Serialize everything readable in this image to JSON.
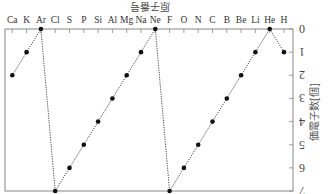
{
  "chart_data": {
    "type": "line",
    "title": "原子番号",
    "xlabel": "",
    "ylabel": "価電子数[個]",
    "orientation_note": "figure rendered rotated 180 degrees (upside-down)",
    "categories": [
      "H",
      "He",
      "Li",
      "Be",
      "B",
      "C",
      "N",
      "O",
      "F",
      "Ne",
      "Na",
      "Mg",
      "Al",
      "Si",
      "P",
      "S",
      "Cl",
      "Ar",
      "K",
      "Ca"
    ],
    "series": [
      {
        "name": "価電子数",
        "values": [
          1,
          0,
          1,
          2,
          3,
          4,
          5,
          6,
          7,
          0,
          1,
          2,
          3,
          4,
          5,
          6,
          7,
          0,
          1,
          2
        ]
      }
    ],
    "y_ticks": [
      0,
      1,
      2,
      3,
      4,
      5,
      6,
      7
    ],
    "ylim": [
      0,
      7
    ],
    "grid": false,
    "line_style": "dotted",
    "marker": "filled-circle"
  },
  "colors": {
    "line": "#333333",
    "marker": "#111111",
    "axis": "#888888"
  }
}
